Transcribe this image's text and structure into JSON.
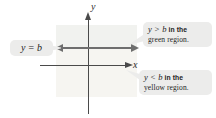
{
  "figure": {
    "background_color": "#ffffff",
    "axes": {
      "x_label": "x",
      "y_label": "y",
      "axis_color": "#4a4a4a"
    },
    "boundary": {
      "label": "y = b",
      "line_color": "#6e6e6e",
      "style": "double-headed horizontal arrow"
    },
    "regions": [
      {
        "name": "green-region",
        "position": "above the line y = b",
        "color": "#f1f2ef",
        "color_name": "green"
      },
      {
        "name": "yellow-region",
        "position": "below the line y = b",
        "color": "#f6f5f1",
        "color_name": "yellow"
      }
    ],
    "callouts": [
      {
        "id": "green",
        "math": "y > b",
        "line1_rest": "in the",
        "line2": "green region.",
        "bubble_color": "#ececeb"
      },
      {
        "id": "yellow",
        "math": "y < b",
        "line1_rest": "in the",
        "line2": "yellow region.",
        "bubble_color": "#ececeb"
      }
    ]
  }
}
